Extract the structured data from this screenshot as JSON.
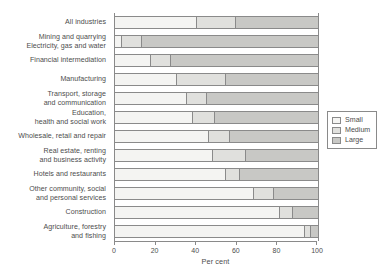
{
  "chart_data": {
    "type": "bar",
    "orientation": "horizontal",
    "stacked": true,
    "stack_mode": "percent",
    "title": "",
    "subtitle": "",
    "xlabel": "Per cent",
    "ylabel": "",
    "xlim": [
      0,
      100
    ],
    "xticks": [
      0,
      20,
      40,
      60,
      80,
      100
    ],
    "xtick_labels": [
      "0",
      "20",
      "40",
      "60",
      "80",
      "100"
    ],
    "grid": false,
    "legend_position": "right",
    "categories": [
      "All industries",
      "Mining and quarrying\nElectricity, gas and water",
      "Financial intermediation",
      "Manufacturing",
      "Transport, storage\nand communication",
      "Education,\nhealth and social work",
      "Wholesale, retail and repair",
      "Real estate, renting\nand business activity",
      "Hotels and restaurants",
      "Other community, social\nand personal services",
      "Construction",
      "Agriculture, forestry\nand fishing"
    ],
    "series": [
      {
        "name": "Small",
        "color": "#f4f4f2",
        "values": [
          40,
          3,
          17,
          30,
          35,
          38,
          46,
          48,
          54,
          68,
          81,
          93
        ]
      },
      {
        "name": "Medium",
        "color": "#e0e0dd",
        "values": [
          19,
          10,
          10,
          24,
          10,
          11,
          10,
          16,
          7,
          10,
          6,
          3
        ]
      },
      {
        "name": "Large",
        "color": "#c8c8c5",
        "values": [
          41,
          87,
          73,
          46,
          55,
          51,
          44,
          36,
          39,
          22,
          13,
          4
        ]
      }
    ]
  },
  "legend": {
    "items": [
      {
        "label": "Small",
        "color": "#f4f4f2"
      },
      {
        "label": "Medium",
        "color": "#e0e0dd"
      },
      {
        "label": "Large",
        "color": "#c8c8c5"
      }
    ]
  }
}
